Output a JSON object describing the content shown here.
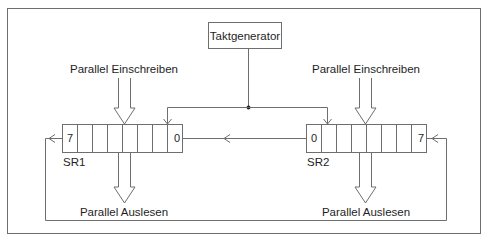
{
  "diagram": {
    "clock": {
      "label": "Taktgenerator"
    },
    "registers": [
      {
        "name": "SR1",
        "left_bit": "7",
        "right_bit": "0",
        "cells": 8,
        "input_label": "Parallel Einschreiben",
        "output_label": "Parallel Auslesen"
      },
      {
        "name": "SR2",
        "left_bit": "0",
        "right_bit": "7",
        "cells": 8,
        "input_label": "Parallel Einschreiben",
        "output_label": "Parallel Auslesen"
      }
    ],
    "connections": [
      {
        "from": "Taktgenerator",
        "to": "SR1",
        "type": "clock"
      },
      {
        "from": "Taktgenerator",
        "to": "SR2",
        "type": "clock"
      },
      {
        "from": "SR2 bit 0",
        "to": "SR1 bit 0",
        "type": "serial-shift"
      },
      {
        "from": "SR1 bit 7",
        "to": "SR2 bit 7",
        "type": "feedback-loop"
      }
    ]
  }
}
